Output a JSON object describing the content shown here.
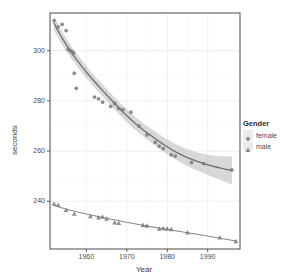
{
  "chart_data": {
    "type": "scatter",
    "title": "",
    "xlabel": "Year",
    "ylabel": "seconds",
    "xlim": [
      1951,
      1998
    ],
    "ylim": [
      221,
      315
    ],
    "xticks": [
      1960,
      1970,
      1980,
      1990
    ],
    "yticks": [
      240,
      260,
      280,
      300
    ],
    "grid": true,
    "legend": {
      "title": "Gender",
      "position": "right",
      "entries": [
        {
          "label": "female",
          "marker": "circle",
          "color": "#7a7a7a"
        },
        {
          "label": "male",
          "marker": "triangle",
          "color": "#7a7a7a"
        }
      ]
    },
    "smooth": {
      "method": "loess",
      "line_color": "#6e6e6e",
      "band_color": "#b8b8b8",
      "band_opacity": 0.55,
      "show_band_female": true,
      "show_band_male": false
    },
    "series": [
      {
        "name": "female",
        "marker": "circle",
        "color": "#7a7a7a",
        "points": [
          {
            "x": 1952,
            "y": 312.0
          },
          {
            "x": 1953,
            "y": 309.5
          },
          {
            "x": 1954,
            "y": 310.5
          },
          {
            "x": 1955,
            "y": 308.0
          },
          {
            "x": 1955.5,
            "y": 300.5
          },
          {
            "x": 1956,
            "y": 300.0
          },
          {
            "x": 1956.5,
            "y": 299.5
          },
          {
            "x": 1956.8,
            "y": 299.0
          },
          {
            "x": 1957,
            "y": 291.0
          },
          {
            "x": 1957.5,
            "y": 285.0
          },
          {
            "x": 1962,
            "y": 281.5
          },
          {
            "x": 1963,
            "y": 280.8
          },
          {
            "x": 1964,
            "y": 279.5
          },
          {
            "x": 1966,
            "y": 277.8
          },
          {
            "x": 1967,
            "y": 279.0
          },
          {
            "x": 1968,
            "y": 277.0
          },
          {
            "x": 1969,
            "y": 276.5
          },
          {
            "x": 1971,
            "y": 275.5
          },
          {
            "x": 1973,
            "y": 270.0
          },
          {
            "x": 1975,
            "y": 266.5
          },
          {
            "x": 1977,
            "y": 263.5
          },
          {
            "x": 1978,
            "y": 262.0
          },
          {
            "x": 1979,
            "y": 261.0
          },
          {
            "x": 1981,
            "y": 258.5
          },
          {
            "x": 1982,
            "y": 258.0
          },
          {
            "x": 1986,
            "y": 255.5
          },
          {
            "x": 1989,
            "y": 255.0
          },
          {
            "x": 1996,
            "y": 252.5
          }
        ]
      },
      {
        "name": "male",
        "marker": "triangle",
        "color": "#7a7a7a",
        "points": [
          {
            "x": 1952,
            "y": 239.0
          },
          {
            "x": 1953,
            "y": 238.5
          },
          {
            "x": 1955,
            "y": 236.5
          },
          {
            "x": 1957,
            "y": 235.0
          },
          {
            "x": 1961,
            "y": 234.0
          },
          {
            "x": 1963,
            "y": 233.5
          },
          {
            "x": 1964,
            "y": 233.8
          },
          {
            "x": 1965,
            "y": 233.0
          },
          {
            "x": 1967,
            "y": 231.5
          },
          {
            "x": 1968,
            "y": 231.3
          },
          {
            "x": 1974,
            "y": 230.5
          },
          {
            "x": 1975,
            "y": 230.2
          },
          {
            "x": 1978,
            "y": 229.0
          },
          {
            "x": 1979,
            "y": 229.2
          },
          {
            "x": 1980,
            "y": 229.0
          },
          {
            "x": 1981,
            "y": 228.8
          },
          {
            "x": 1985,
            "y": 227.5
          },
          {
            "x": 1993,
            "y": 225.5
          },
          {
            "x": 1997,
            "y": 224.0
          }
        ]
      }
    ]
  }
}
